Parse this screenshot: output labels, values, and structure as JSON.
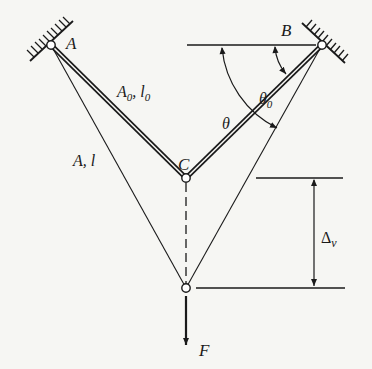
{
  "diagram": {
    "type": "two-bar truss under vertical load",
    "colors": {
      "ink": "#1a1a1a",
      "background": "#f6f6f3",
      "pin_fill": "#ffffff"
    },
    "nodes": {
      "A": {
        "label": "A",
        "role": "fixed pin support (upper left)"
      },
      "B": {
        "label": "B",
        "role": "fixed pin support (upper right)"
      },
      "C": {
        "label": "C",
        "role": "initial joint position"
      },
      "D": {
        "label": "",
        "role": "displaced joint position"
      }
    },
    "members": {
      "initial": {
        "label_area": "A",
        "label_sub": "0",
        "label_sep": ", ",
        "label_len": "l",
        "label_len_sub": "0"
      },
      "deformed": {
        "label_area": "A",
        "label_sep": ", ",
        "label_len": "l"
      }
    },
    "angles": {
      "theta0": {
        "symbol": "θ",
        "sub": "0"
      },
      "theta": {
        "symbol": "θ"
      }
    },
    "displacement": {
      "symbol": "Δ",
      "sub": "v"
    },
    "load": {
      "symbol": "F",
      "direction": "down"
    }
  }
}
